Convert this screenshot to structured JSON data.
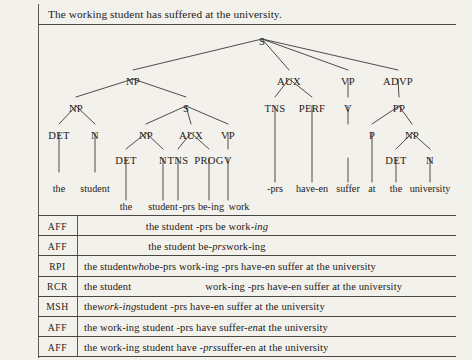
{
  "caption": "The working student has suffered at the university.",
  "tree": {
    "nodes": [
      {
        "label": "S",
        "x": 262,
        "y": 36
      },
      {
        "label": "NP",
        "x": 133,
        "y": 76
      },
      {
        "label": "AUX",
        "x": 289,
        "y": 76
      },
      {
        "label": "VP",
        "x": 348,
        "y": 76
      },
      {
        "label": "ADVP",
        "x": 398,
        "y": 76
      },
      {
        "label": "NP",
        "x": 76,
        "y": 103
      },
      {
        "label": "S",
        "x": 186,
        "y": 103
      },
      {
        "label": "TNS",
        "x": 275,
        "y": 103
      },
      {
        "label": "PERF",
        "x": 312,
        "y": 103
      },
      {
        "label": "V",
        "x": 348,
        "y": 103
      },
      {
        "label": "PP",
        "x": 399,
        "y": 103
      },
      {
        "label": "DET",
        "x": 59,
        "y": 130
      },
      {
        "label": "N",
        "x": 95,
        "y": 130
      },
      {
        "label": "NP",
        "x": 146,
        "y": 130
      },
      {
        "label": "AUX",
        "x": 191,
        "y": 130
      },
      {
        "label": "VP",
        "x": 228,
        "y": 130
      },
      {
        "label": "P",
        "x": 372,
        "y": 130
      },
      {
        "label": "NP",
        "x": 412,
        "y": 130
      },
      {
        "label": "DET",
        "x": 126,
        "y": 155
      },
      {
        "label": "N",
        "x": 163,
        "y": 155
      },
      {
        "label": "TNS",
        "x": 178,
        "y": 155
      },
      {
        "label": "PROG",
        "x": 209,
        "y": 155
      },
      {
        "label": "V",
        "x": 228,
        "y": 155
      },
      {
        "label": "DET",
        "x": 396,
        "y": 155
      },
      {
        "label": "N",
        "x": 430,
        "y": 155
      }
    ],
    "edges": [
      [
        262,
        39,
        133,
        70
      ],
      [
        262,
        39,
        289,
        70
      ],
      [
        262,
        39,
        348,
        70
      ],
      [
        262,
        39,
        398,
        70
      ],
      [
        133,
        79,
        76,
        97
      ],
      [
        133,
        79,
        186,
        97
      ],
      [
        289,
        79,
        275,
        97
      ],
      [
        289,
        79,
        312,
        97
      ],
      [
        348,
        79,
        348,
        97
      ],
      [
        398,
        79,
        399,
        97
      ],
      [
        76,
        106,
        59,
        124
      ],
      [
        76,
        106,
        95,
        124
      ],
      [
        186,
        106,
        146,
        124
      ],
      [
        186,
        106,
        191,
        124
      ],
      [
        186,
        106,
        228,
        124
      ],
      [
        275,
        106,
        275,
        182
      ],
      [
        312,
        106,
        312,
        182
      ],
      [
        348,
        106,
        348,
        124
      ],
      [
        399,
        106,
        372,
        124
      ],
      [
        399,
        106,
        412,
        124
      ],
      [
        59,
        133,
        59,
        172
      ],
      [
        95,
        133,
        95,
        172
      ],
      [
        146,
        133,
        126,
        149
      ],
      [
        146,
        133,
        163,
        149
      ],
      [
        191,
        133,
        178,
        149
      ],
      [
        191,
        133,
        209,
        149
      ],
      [
        228,
        133,
        228,
        149
      ],
      [
        372,
        133,
        372,
        182
      ],
      [
        412,
        133,
        396,
        149
      ],
      [
        412,
        133,
        430,
        149
      ],
      [
        126,
        158,
        126,
        200
      ],
      [
        163,
        158,
        163,
        200
      ],
      [
        178,
        158,
        178,
        200
      ],
      [
        209,
        158,
        209,
        200
      ],
      [
        228,
        158,
        228,
        200
      ],
      [
        348,
        158,
        348,
        182
      ],
      [
        396,
        158,
        396,
        182
      ],
      [
        430,
        158,
        430,
        182
      ]
    ],
    "leaves_upper": [
      {
        "text": "the",
        "x": 59,
        "y": 183
      },
      {
        "text": "student",
        "x": 95,
        "y": 183
      },
      {
        "text": "-prs",
        "x": 275,
        "y": 183
      },
      {
        "text": "have-en",
        "x": 312,
        "y": 183
      },
      {
        "text": "suffer",
        "x": 348,
        "y": 183
      },
      {
        "text": "at",
        "x": 372,
        "y": 183
      },
      {
        "text": "the",
        "x": 396,
        "y": 183
      },
      {
        "text": "university",
        "x": 430,
        "y": 183
      }
    ],
    "leaves_lower": [
      {
        "text": "the",
        "x": 126,
        "y": 201
      },
      {
        "text": "student",
        "x": 163,
        "y": 201
      },
      {
        "text": "-prs",
        "x": 187,
        "y": 201
      },
      {
        "text": "be-ing",
        "x": 211,
        "y": 201
      },
      {
        "text": "work",
        "x": 239,
        "y": 201
      }
    ]
  },
  "table": {
    "rows": [
      {
        "label": "AFF",
        "style": "indent",
        "parts": [
          {
            "t": "the student -prs be work-",
            "i": false
          },
          {
            "t": "ing",
            "i": true
          }
        ]
      },
      {
        "label": "AFF",
        "style": "indent",
        "parts": [
          {
            "t": "the student be-",
            "i": false
          },
          {
            "t": "prs",
            "i": true
          },
          {
            "t": " work-ing",
            "i": false
          }
        ]
      },
      {
        "label": "RPI",
        "style": "pad",
        "parts": [
          {
            "t": "the student ",
            "i": false
          },
          {
            "t": "who",
            "i": true
          },
          {
            "t": " be-prs work-ing -prs have-en suffer at the university",
            "i": false
          }
        ]
      },
      {
        "label": "RCR",
        "style": "gap",
        "parts": [
          {
            "t": "the student",
            "i": false
          },
          {
            "t": "GAP",
            "i": false
          },
          {
            "t": "work-ing -prs have-en suffer at the university",
            "i": false
          }
        ]
      },
      {
        "label": "MSH",
        "style": "pad",
        "parts": [
          {
            "t": "the ",
            "i": false
          },
          {
            "t": "work-ing",
            "i": true
          },
          {
            "t": " student -prs have-en suffer at the university",
            "i": false
          }
        ]
      },
      {
        "label": "AFF",
        "style": "pad",
        "parts": [
          {
            "t": "the work-ing student -prs have suffer-",
            "i": false
          },
          {
            "t": "en",
            "i": true
          },
          {
            "t": " at the university",
            "i": false
          }
        ]
      },
      {
        "label": "AFF",
        "style": "pad",
        "parts": [
          {
            "t": "the work-ing student have -",
            "i": false
          },
          {
            "t": "prs",
            "i": true
          },
          {
            "t": " suffer-en at the university",
            "i": false
          }
        ]
      }
    ]
  }
}
